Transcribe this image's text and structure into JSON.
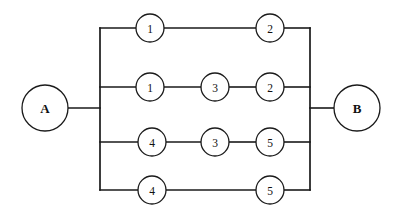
{
  "diagram": {
    "type": "reliability-block-diagram",
    "background_color": "#ffffff",
    "line_color": "#1a1a1a",
    "node_fill_color": "#ffffff",
    "terminals": [
      {
        "id": "A",
        "label": "A",
        "cx": 45,
        "cy": 108,
        "r": 23,
        "side": "left"
      },
      {
        "id": "B",
        "label": "B",
        "cx": 357,
        "cy": 108,
        "r": 23,
        "side": "right"
      }
    ],
    "bus_left_x": 100,
    "bus_right_x": 310,
    "bus_top_y": 28,
    "bus_bottom_y": 190,
    "branches": [
      {
        "row": 1,
        "y": 28,
        "nodes": [
          {
            "label": "1",
            "cx": 150,
            "cy": 28,
            "r": 14
          },
          {
            "label": "2",
            "cx": 270,
            "cy": 28,
            "r": 14
          }
        ]
      },
      {
        "row": 2,
        "y": 87,
        "nodes": [
          {
            "label": "1",
            "cx": 150,
            "cy": 87,
            "r": 14
          },
          {
            "label": "3",
            "cx": 215,
            "cy": 87,
            "r": 14
          },
          {
            "label": "2",
            "cx": 270,
            "cy": 87,
            "r": 14
          }
        ]
      },
      {
        "row": 3,
        "y": 142,
        "nodes": [
          {
            "label": "4",
            "cx": 152,
            "cy": 142,
            "r": 14
          },
          {
            "label": "3",
            "cx": 215,
            "cy": 142,
            "r": 14
          },
          {
            "label": "5",
            "cx": 270,
            "cy": 142,
            "r": 14
          }
        ]
      },
      {
        "row": 4,
        "y": 190,
        "nodes": [
          {
            "label": "4",
            "cx": 152,
            "cy": 190,
            "r": 14
          },
          {
            "label": "5",
            "cx": 270,
            "cy": 190,
            "r": 14
          }
        ]
      }
    ]
  }
}
